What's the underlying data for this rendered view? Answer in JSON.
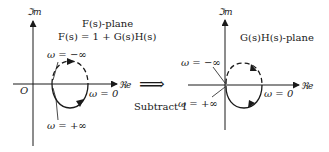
{
  "left_plane": {
    "im_axis_label": "ℑm",
    "re_axis_label": "ℜe",
    "origin_label": "O",
    "title": "F(s)-plane",
    "equation": "F(s) = 1 + G(s)H(s)",
    "label_omega_neg_inf": "ω = −∞",
    "label_omega_pos_inf": "ω = +∞",
    "label_omega_zero": "ω = 0"
  },
  "transform": {
    "arrow_symbol": "⟹",
    "label": "Subtract 1"
  },
  "right_plane": {
    "im_axis_label": "ℑm",
    "re_axis_label": "ℜe",
    "title": "G(s)H(s)-plane",
    "label_omega_neg_inf": "ω = −∞",
    "label_omega_pos_inf": "ω = +∞",
    "label_omega_zero": "ω = 0"
  },
  "colors": {
    "ink": "#1a1a1a",
    "background": "#ffffff"
  }
}
